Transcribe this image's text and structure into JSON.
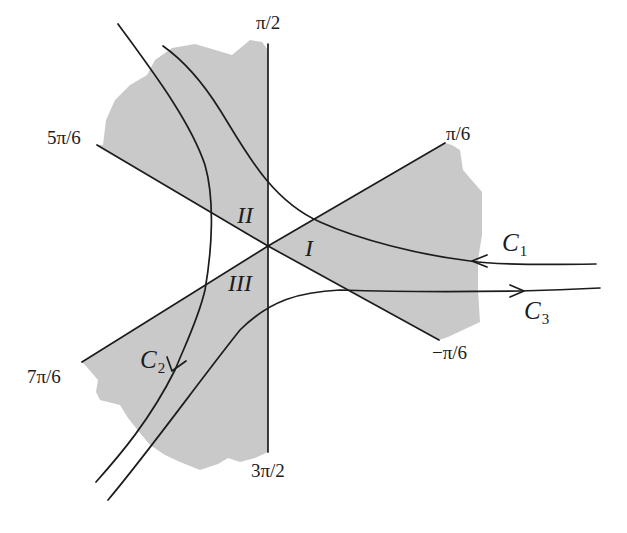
{
  "diagram": {
    "type": "stokes-sectors",
    "center": {
      "x": 268,
      "y": 246
    },
    "colors": {
      "shade": "#c9c9c9",
      "line": "#1c1c1c",
      "background": "#ffffff"
    },
    "rays": [
      {
        "angle_label": "π/2",
        "label": "π/2"
      },
      {
        "angle_label": "π/6",
        "label": "π/6"
      },
      {
        "angle_label": "5π/6",
        "label": "5π/6"
      },
      {
        "angle_label": "7π/6",
        "label": "7π/6"
      },
      {
        "angle_label": "−π/6",
        "label": "−π/6"
      },
      {
        "angle_label": "3π/2",
        "label": "3π/2"
      }
    ],
    "regions": [
      {
        "label": "I"
      },
      {
        "label": "II"
      },
      {
        "label": "III"
      }
    ],
    "contours": [
      {
        "name": "C",
        "subscript": "1",
        "direction": "incoming from right, exits upper-left"
      },
      {
        "name": "C",
        "subscript": "2",
        "direction": "from top, downward to lower-left"
      },
      {
        "name": "C",
        "subscript": "3",
        "direction": "from lower-left, outgoing to right"
      }
    ]
  }
}
